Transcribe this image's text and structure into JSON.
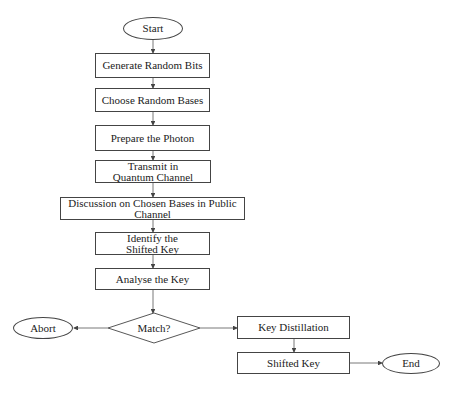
{
  "diagram": {
    "type": "flowchart",
    "nodes": {
      "start": "Start",
      "generate": "Generate Random Bits",
      "choose": "Choose Random Bases",
      "prepare": "Prepare the Photon",
      "transmit": "Transmit in Quantum Channel",
      "discussion": "Discussion on Chosen Bases in Public Channel",
      "identify": "Identify the Shifted Key",
      "analyse": "Analyse the Key",
      "match": "Match?",
      "abort": "Abort",
      "distillation": "Key Distillation",
      "shifted": "Shifted Key",
      "end": "End"
    },
    "edges": [
      [
        "start",
        "generate"
      ],
      [
        "generate",
        "choose"
      ],
      [
        "choose",
        "prepare"
      ],
      [
        "prepare",
        "transmit"
      ],
      [
        "transmit",
        "discussion"
      ],
      [
        "discussion",
        "identify"
      ],
      [
        "identify",
        "analyse"
      ],
      [
        "analyse",
        "match"
      ],
      [
        "match",
        "abort"
      ],
      [
        "match",
        "distillation"
      ],
      [
        "distillation",
        "shifted"
      ],
      [
        "shifted",
        "end"
      ]
    ],
    "colors": {
      "line": "#444444",
      "text": "#222222",
      "background": "#ffffff"
    }
  }
}
